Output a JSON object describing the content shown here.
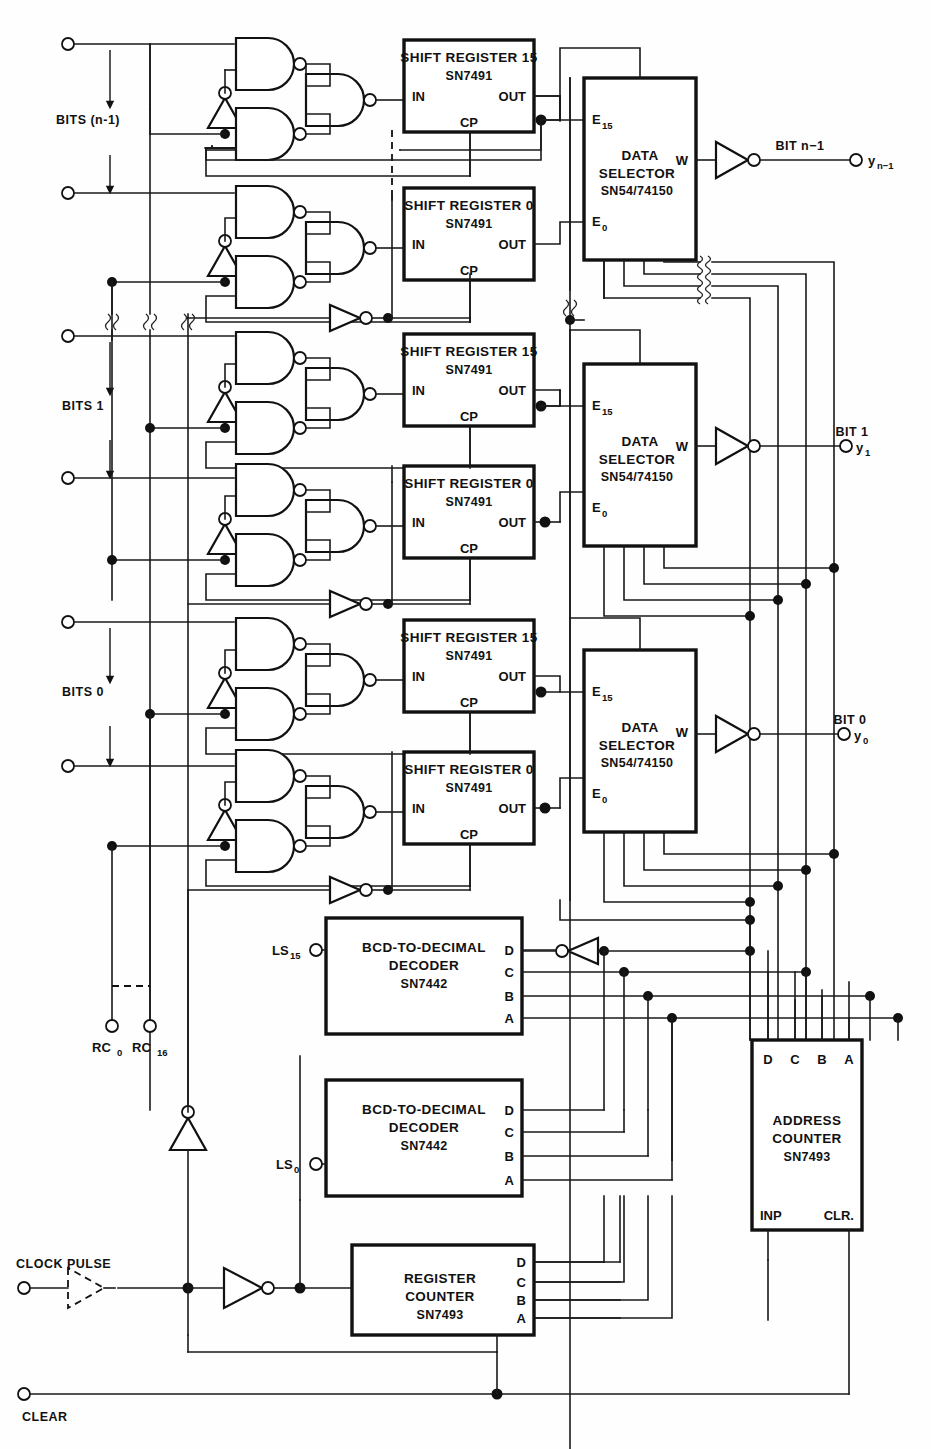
{
  "diagram": {
    "line_color": "#111111",
    "background": "#ffffff"
  },
  "input_groups": [
    {
      "label": "BITS (n-1)",
      "id": "bits-n-1"
    },
    {
      "label": "BITS 1",
      "id": "bits-1"
    },
    {
      "label": "BITS 0",
      "id": "bits-0"
    }
  ],
  "shift_registers": [
    {
      "title": "SHIFT REGISTER 15",
      "part": "SN7491",
      "pin_in": "IN",
      "pin_out": "OUT",
      "pin_cp": "CP"
    },
    {
      "title": "SHIFT REGISTER 0",
      "part": "SN7491",
      "pin_in": "IN",
      "pin_out": "OUT",
      "pin_cp": "CP"
    },
    {
      "title": "SHIFT REGISTER 15",
      "part": "SN7491",
      "pin_in": "IN",
      "pin_out": "OUT",
      "pin_cp": "CP"
    },
    {
      "title": "SHIFT REGISTER 0",
      "part": "SN7491",
      "pin_in": "IN",
      "pin_out": "OUT",
      "pin_cp": "CP"
    },
    {
      "title": "SHIFT REGISTER 15",
      "part": "SN7491",
      "pin_in": "IN",
      "pin_out": "OUT",
      "pin_cp": "CP"
    },
    {
      "title": "SHIFT REGISTER 0",
      "part": "SN7491",
      "pin_in": "IN",
      "pin_out": "OUT",
      "pin_cp": "CP"
    }
  ],
  "data_selectors": [
    {
      "line1": "DATA",
      "line2": "SELECTOR",
      "part": "SN54/74150",
      "pin_e15": "E",
      "pin_e15_sub": "15",
      "pin_e0": "E",
      "pin_e0_sub": "0",
      "pin_w": "W",
      "out_label": "BIT n−1",
      "out_name": "y",
      "out_sub": "n−1"
    },
    {
      "line1": "DATA",
      "line2": "SELECTOR",
      "part": "SN54/74150",
      "pin_e15": "E",
      "pin_e15_sub": "15",
      "pin_e0": "E",
      "pin_e0_sub": "0",
      "pin_w": "W",
      "out_label": "BIT 1",
      "out_name": "y",
      "out_sub": "1"
    },
    {
      "line1": "DATA",
      "line2": "SELECTOR",
      "part": "SN54/74150",
      "pin_e15": "E",
      "pin_e15_sub": "15",
      "pin_e0": "E",
      "pin_e0_sub": "0",
      "pin_w": "W",
      "out_label": "BIT 0",
      "out_name": "y",
      "out_sub": "0"
    }
  ],
  "decoders": [
    {
      "line1": "BCD-TO-DECIMAL",
      "line2": "DECODER",
      "part": "SN7442",
      "input_label": "LS",
      "input_sub": "15",
      "pins": [
        "D",
        "C",
        "B",
        "A"
      ]
    },
    {
      "line1": "BCD-TO-DECIMAL",
      "line2": "DECODER",
      "part": "SN7442",
      "input_label": "LS",
      "input_sub": "0",
      "pins": [
        "D",
        "C",
        "B",
        "A"
      ]
    }
  ],
  "address_counter": {
    "line1": "ADDRESS",
    "line2": "COUNTER",
    "part": "SN7493",
    "top_pins": [
      "D",
      "C",
      "B",
      "A"
    ],
    "pin_inp": "INP",
    "pin_clr": "CLR."
  },
  "register_counter": {
    "line1": "REGISTER",
    "line2": "COUNTER",
    "part": "SN7493",
    "right_pins": [
      "D",
      "C",
      "B",
      "A"
    ]
  },
  "signals": {
    "clock_pulse": "CLOCK PULSE",
    "clear": "CLEAR",
    "rc0_label": "RC",
    "rc0_sub": "0",
    "rc16_label": "RC",
    "rc16_sub": "16"
  }
}
